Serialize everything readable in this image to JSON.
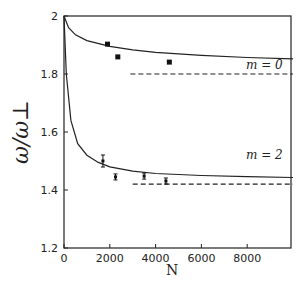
{
  "chart_data": {
    "type": "line",
    "title": "",
    "xlabel": "N",
    "ylabel": "ω/ω⊥",
    "xlim": [
      0,
      10000
    ],
    "ylim": [
      1.2,
      2.0
    ],
    "x_ticks": [
      "0",
      "2000",
      "4000",
      "6000",
      "8000"
    ],
    "y_ticks": [
      "1.2",
      "1.4",
      "1.6",
      "1.8",
      "2"
    ],
    "grid": false,
    "annotations": [
      "m = 0",
      "m = 2"
    ],
    "series": [
      {
        "name": "m = 0 theory (solid)",
        "style": "solid",
        "x": [
          0,
          200,
          500,
          1000,
          2000,
          3000,
          4000,
          6000,
          8000,
          10000
        ],
        "values": [
          2.0,
          1.96,
          1.935,
          1.915,
          1.895,
          1.883,
          1.875,
          1.864,
          1.857,
          1.852
        ]
      },
      {
        "name": "m = 0 asymptote (dashed)",
        "style": "dashed",
        "x": [
          2900,
          10000
        ],
        "values": [
          1.8,
          1.8
        ]
      },
      {
        "name": "m = 0 data",
        "style": "points",
        "x": [
          1900,
          2350,
          4600
        ],
        "values": [
          1.903,
          1.859,
          1.841
        ]
      },
      {
        "name": "m = 2 theory (solid)",
        "style": "solid",
        "x": [
          0,
          100,
          300,
          600,
          1000,
          1500,
          2000,
          3000,
          4000,
          6000,
          8000,
          10000
        ],
        "values": [
          2.0,
          1.8,
          1.64,
          1.56,
          1.52,
          1.495,
          1.48,
          1.465,
          1.457,
          1.45,
          1.446,
          1.443
        ]
      },
      {
        "name": "m = 2 asymptote (dashed)",
        "style": "dashed",
        "x": [
          3000,
          10000
        ],
        "values": [
          1.42,
          1.42
        ]
      },
      {
        "name": "m = 2 data",
        "style": "points-errorbars",
        "x": [
          1700,
          2250,
          3500,
          4450
        ],
        "values": [
          1.5,
          1.445,
          1.448,
          1.431
        ]
      }
    ]
  },
  "labels": {
    "xlabel": "N",
    "ylabel": "ω/ω⊥",
    "m0": "m = 0",
    "m2": "m = 2",
    "xt": [
      "0",
      "2000",
      "4000",
      "6000",
      "8000"
    ],
    "yt": [
      "1.2",
      "1.4",
      "1.6",
      "1.8",
      "2"
    ]
  }
}
